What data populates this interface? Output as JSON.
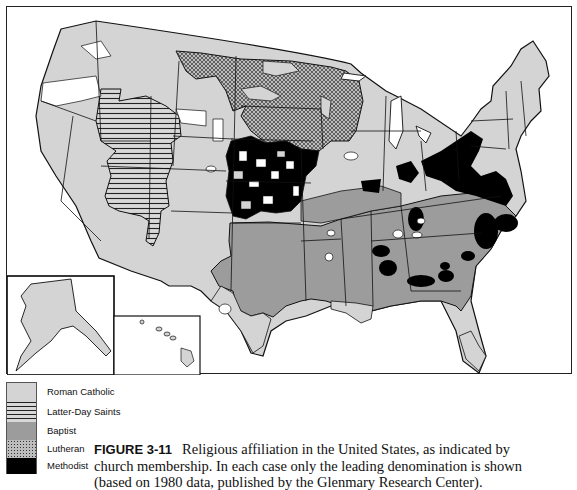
{
  "figure": {
    "label": "FIGURE 3-11",
    "caption_line1": "Religious affiliation in the United States, as indicated by",
    "caption_line2": "church membership. In each case only the leading denomination is shown",
    "caption_line3": "(based on 1980 data, published by the Glenmary Research Center)."
  },
  "map": {
    "subject": "Leading religious denomination by county, United States",
    "insets": [
      "Alaska",
      "Hawaii"
    ],
    "patterns": {
      "roman_catholic": {
        "fill": "#d4d4d4",
        "style": "solid light gray"
      },
      "latter_day_saints": {
        "fill": "#d4d4d4",
        "style": "horizontal lines"
      },
      "baptist": {
        "fill": "#9a9a9a",
        "style": "solid medium gray"
      },
      "lutheran": {
        "fill": "#8a8a8a",
        "style": "dotted crosshatch"
      },
      "methodist": {
        "fill": "#000000",
        "style": "solid black"
      },
      "none": {
        "fill": "#ffffff",
        "style": "white"
      }
    },
    "regions": [
      {
        "area": "Pacific Coast & Southwest",
        "denomination": "Roman Catholic"
      },
      {
        "area": "Utah, Idaho, eastern Nevada",
        "denomination": "Latter-Day Saints"
      },
      {
        "area": "Northern Plains (Dakotas, Minnesota)",
        "denomination": "Lutheran"
      },
      {
        "area": "Kansas, Nebraska, Iowa patches",
        "denomination": "Methodist"
      },
      {
        "area": "South (Texas to Carolinas)",
        "denomination": "Baptist"
      },
      {
        "area": "Northeast, Great Lakes, Louisiana, South Texas, Florida tip",
        "denomination": "Roman Catholic"
      },
      {
        "area": "Pennsylvania, Ohio, Delaware/Maryland, scattered South",
        "denomination": "Methodist"
      }
    ]
  },
  "legend": {
    "items": [
      {
        "label": "Roman Catholic",
        "pattern": "roman_catholic"
      },
      {
        "label": "Latter-Day Saints",
        "pattern": "latter_day_saints"
      },
      {
        "label": "Baptist",
        "pattern": "baptist"
      },
      {
        "label": "Lutheran",
        "pattern": "lutheran"
      },
      {
        "label": "Methodist",
        "pattern": "methodist"
      }
    ]
  }
}
